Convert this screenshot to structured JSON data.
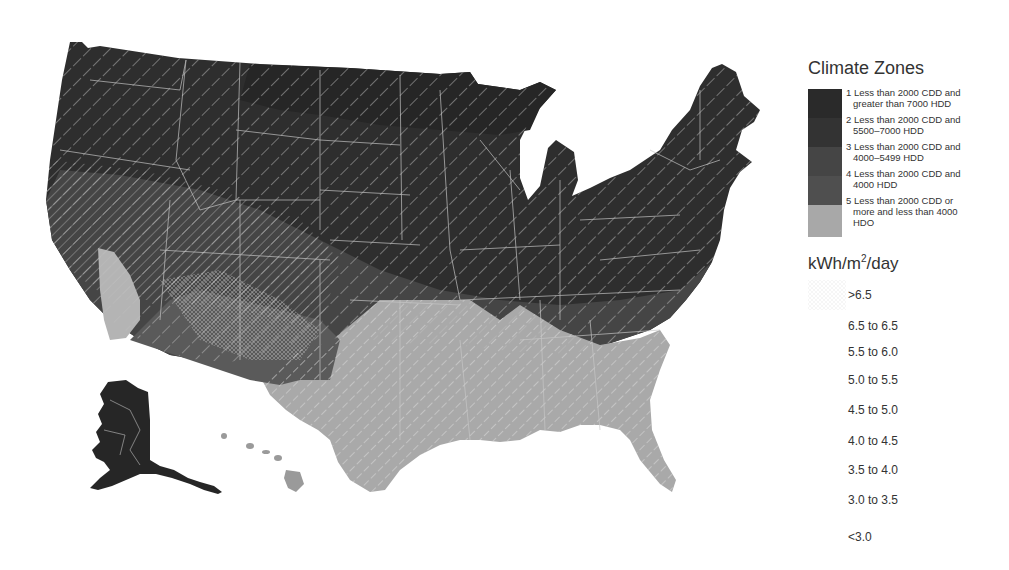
{
  "map": {
    "title": "Contiguous US, Alaska and Hawaii climate zones with solar insolation overlay",
    "colors": {
      "zone1": "#2b2b2b",
      "zone2": "#363636",
      "zone3": "#4a4a4a",
      "zone4": "#5c5c5c",
      "zone5": "#a6a6a6",
      "border": "#c8c8c8",
      "hatch": "#d0d0d0"
    }
  },
  "legend": {
    "climate_title": "Climate Zones",
    "zones": [
      {
        "num": "1",
        "line1": "Less than 2000 CDD and",
        "line2": "greater than 7000 HDD",
        "color": "#2a2a2a"
      },
      {
        "num": "2",
        "line1": "Less than 2000 CDD and",
        "line2": "5500–7000 HDD",
        "color": "#333333"
      },
      {
        "num": "3",
        "line1": "Less than 2000 CDD and",
        "line2": "4000–5499 HDD",
        "color": "#454545"
      },
      {
        "num": "4",
        "line1": "Less than 2000 CDD and",
        "line2": "4000 HDD",
        "color": "#4f4f4f"
      },
      {
        "num": "5",
        "line1": "Less than 2000 CDD or",
        "line2": "more and less than 4000",
        "line3": "HDO",
        "color": "#a8a8a8"
      }
    ],
    "kwh_title_main": "kWh/m",
    "kwh_title_sup": "2",
    "kwh_title_tail": "/day",
    "kwh_items": [
      ">6.5",
      "6.5 to 6.5",
      "5.5 to 6.0",
      "5.0 to 5.5",
      "4.5 to 5.0",
      "4.0 to 4.5",
      "3.5 to 4.0",
      "3.0 to 3.5",
      "<3.0"
    ]
  }
}
